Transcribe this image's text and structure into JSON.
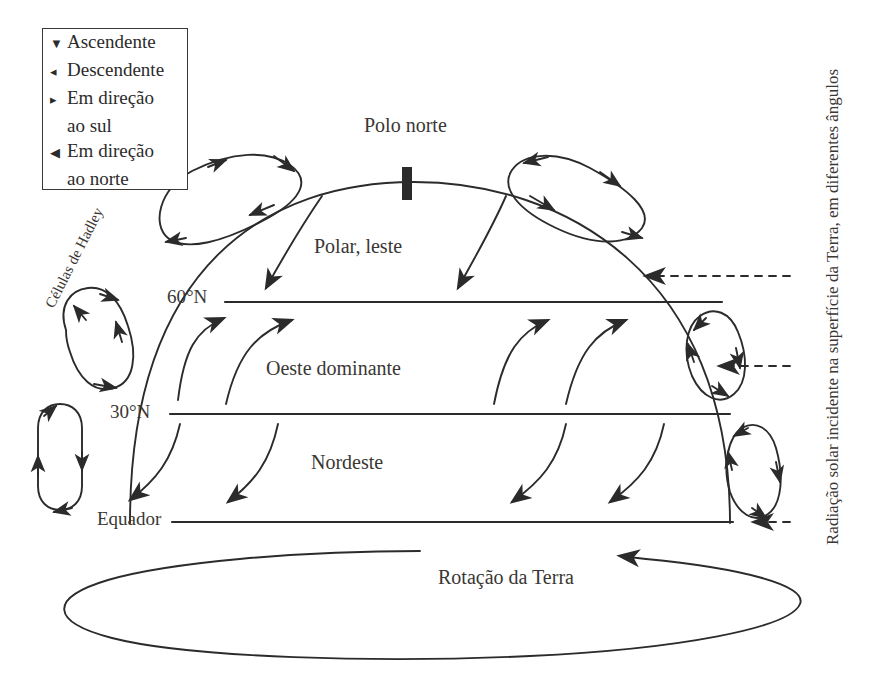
{
  "diagram": {
    "legend": {
      "items": [
        {
          "glyph": "down-triangle",
          "symbol": "▼",
          "label": "Ascendente",
          "label_cont": ""
        },
        {
          "glyph": "up-left-triangle",
          "symbol": "◂",
          "label": "Descendente",
          "label_cont": ""
        },
        {
          "glyph": "right-triangle",
          "symbol": "▸",
          "label": "Em direção",
          "label_cont": "ao sul"
        },
        {
          "glyph": "left-triangle",
          "symbol": "◀",
          "label": "Em direção",
          "label_cont": "ao norte"
        }
      ]
    },
    "labels": {
      "pole": "Polo norte",
      "polar_easterlies": "Polar, leste",
      "westerlies": "Oeste dominante",
      "trade_winds": "Nordeste",
      "hadley_cells": "Células de Hadley",
      "rotation": "Rotação da Terra",
      "solar_radiation": "Radiação solar incidente na superfície da Terra, em diferentes ângulos"
    },
    "latitudes": [
      {
        "name": "sixty-north",
        "label": "60°N"
      },
      {
        "name": "thirty-north",
        "label": "30°N"
      },
      {
        "name": "equator",
        "label": "Equador"
      }
    ],
    "colors": {
      "ink": "#2b2b2b",
      "text": "#3a3734",
      "background": "#ffffff"
    }
  }
}
